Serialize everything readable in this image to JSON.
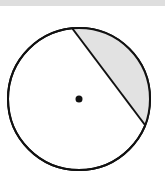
{
  "diagram": {
    "type": "circle-with-chord-segment",
    "circle": {
      "cx": 79,
      "cy": 99,
      "r": 71,
      "stroke": "#111111",
      "fill": "#ffffff"
    },
    "chord": {
      "x1": 72,
      "y1": 28,
      "x2": 145,
      "y2": 125,
      "stroke": "#111111"
    },
    "shaded_segment": {
      "fill": "#e2e2e2",
      "description": "minor segment cut off by chord, upper-right side"
    },
    "center_point": {
      "cx": 79,
      "cy": 99,
      "r": 3.5,
      "fill": "#111111"
    },
    "top_strip_color": "#dedede"
  }
}
